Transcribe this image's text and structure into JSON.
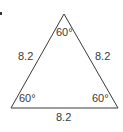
{
  "diagram": {
    "type": "equilateral-triangle",
    "colors": {
      "stroke": "#3a3a3a",
      "text": "#3a3a3a",
      "background": "#ffffff"
    },
    "vertices": {
      "apex": [
        64,
        14
      ],
      "bottom_left": [
        11,
        108
      ],
      "bottom_right": [
        118,
        108
      ]
    },
    "sides": {
      "left": "8.2",
      "right": "8.2",
      "bottom": "8.2"
    },
    "angles": {
      "apex": "60°",
      "bottom_left": "60°",
      "bottom_right": "60°"
    },
    "marker": "•"
  }
}
